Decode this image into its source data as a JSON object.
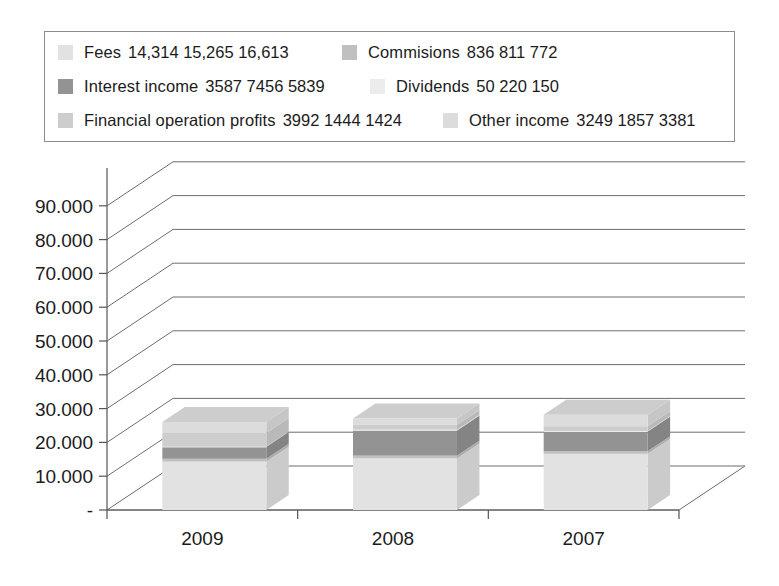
{
  "chart_data": {
    "type": "bar",
    "subtype": "stacked-3d-column",
    "title": "",
    "xlabel": "",
    "ylabel": "",
    "categories": [
      "2009",
      "2008",
      "2007"
    ],
    "ylim": [
      0,
      100000
    ],
    "yticks": [
      0,
      10000,
      20000,
      30000,
      40000,
      50000,
      60000,
      70000,
      80000,
      90000
    ],
    "ytick_labels": [
      "-",
      "10.000",
      "20.000",
      "30.000",
      "40.000",
      "50.000",
      "60.000",
      "70.000",
      "80.000",
      "90.000"
    ],
    "grid": true,
    "legend_position": "top",
    "stacked": true,
    "series": [
      {
        "name": "Fees",
        "values": [
          14314,
          15265,
          16613
        ],
        "display_values": [
          "14,314",
          "15,265",
          "16,613"
        ],
        "color": "#e2e2e2"
      },
      {
        "name": "Commisions",
        "values": [
          836,
          811,
          772
        ],
        "display_values": [
          "836",
          "811",
          "772"
        ],
        "color": "#c0c0c0"
      },
      {
        "name": "Interest income",
        "values": [
          3587,
          7456,
          5839
        ],
        "display_values": [
          "3587",
          "7456",
          "5839"
        ],
        "color": "#939393"
      },
      {
        "name": "Dividends",
        "values": [
          50,
          220,
          150
        ],
        "display_values": [
          "50",
          "220",
          "150"
        ],
        "color": "#ececec"
      },
      {
        "name": "Financial operation profits",
        "values": [
          3992,
          1444,
          1424
        ],
        "display_values": [
          "3992",
          "1444",
          "1424"
        ],
        "color": "#cdcdcd"
      },
      {
        "name": "Other income",
        "values": [
          3249,
          1857,
          3381
        ],
        "display_values": [
          "3249",
          "1857",
          "3381"
        ],
        "color": "#dcdcdc"
      }
    ]
  },
  "legend": {
    "entries": [
      {
        "name": "Fees",
        "values_text": "14,314  15,265  16,613"
      },
      {
        "name": "Commisions",
        "values_text": "836  811  772"
      },
      {
        "name": "Interest income",
        "values_text": "3587  7456  5839"
      },
      {
        "name": "Dividends",
        "values_text": "50  220  150"
      },
      {
        "name": "Financial operation profits",
        "values_text": "3992 1444 1424"
      },
      {
        "name": "Other income",
        "values_text": "3249  1857  3381"
      }
    ]
  },
  "axes": {
    "y_labels": [
      "90.000",
      "80.000",
      "70.000",
      "60.000",
      "50.000",
      "40.000",
      "30.000",
      "20.000",
      "10.000",
      "-"
    ],
    "x_labels": [
      "2009",
      "2008",
      "2007"
    ]
  }
}
